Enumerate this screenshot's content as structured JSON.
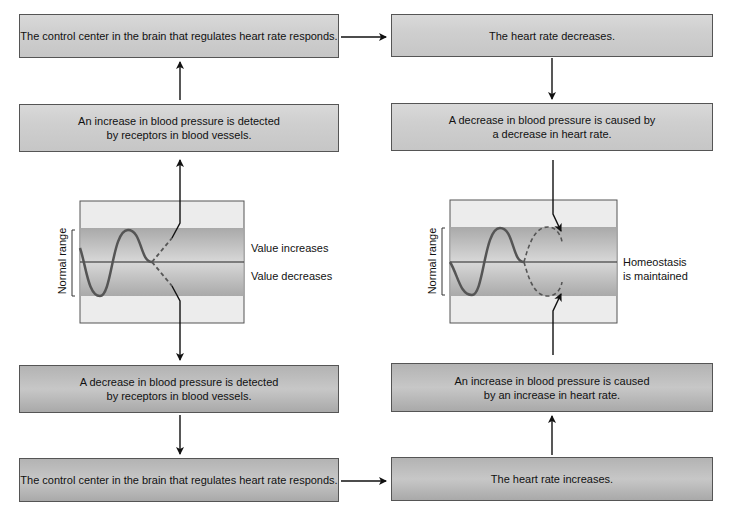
{
  "left_column": {
    "box_top": "The control center in the brain that regulates heart rate responds.",
    "box_increase_detected": "An increase in blood pressure is detected by receptors in blood vessels.",
    "box_increase_detected_l1": "An increase in blood pressure is detected",
    "box_increase_detected_l2": "by receptors in blood vessels.",
    "box_decrease_detected_l1": "A decrease in blood pressure is detected",
    "box_decrease_detected_l2": "by receptors in blood vessels.",
    "box_bottom": "The control center in the brain that regulates heart rate responds.",
    "graph": {
      "axis_label": "Normal range",
      "label_up": "Value increases",
      "label_down": "Value decreases"
    }
  },
  "right_column": {
    "box_top": "The heart rate decreases.",
    "box_decrease_caused_l1": "A decrease in blood pressure is caused by",
    "box_decrease_caused_l2": "a decrease in heart rate.",
    "box_increase_caused_l1": "An increase in blood pressure is caused",
    "box_increase_caused_l2": "by an increase in heart rate.",
    "box_bottom": "The heart rate increases.",
    "graph": {
      "axis_label": "Normal range",
      "label_l1": "Homeostasis",
      "label_l2": "is maintained"
    }
  },
  "colors": {
    "light_box": "#d0d0d0",
    "dark_box": "#b0b0b0",
    "band": "#b8b8b8",
    "graph_bg": "#ededed",
    "line": "#111111",
    "curve": "#555555"
  }
}
